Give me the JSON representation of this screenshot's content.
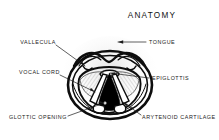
{
  "figure": {
    "title": "ANATOMY",
    "colors": {
      "background": "#ffffff",
      "ink": "#0d0d0d",
      "label_text": "#1a1a1a",
      "glottis_fill": "#000000",
      "cord_fill": "#ffffff",
      "hatch": "#6b6b6b"
    },
    "labels": [
      {
        "id": "vallecula",
        "text": "VALLECULA",
        "side": "left"
      },
      {
        "id": "vocal-cord",
        "text": "VOCAL CORD",
        "side": "left"
      },
      {
        "id": "glottic-opening",
        "text": "GLOTTIC OPENING",
        "side": "left"
      },
      {
        "id": "tongue",
        "text": "TONGUE",
        "side": "right"
      },
      {
        "id": "epiglottis",
        "text": "EPIGLOTTIS",
        "side": "right"
      },
      {
        "id": "arytenoid-cartilage",
        "text": "ARYTENOID CARTILAGE",
        "side": "right"
      }
    ]
  }
}
